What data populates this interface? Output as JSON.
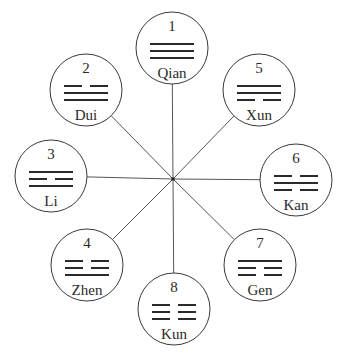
{
  "diagram": {
    "title": "",
    "center": {
      "x": 173,
      "y": 179
    },
    "circle_radius": 36,
    "line_color": "#555555",
    "stroke_color": "#3a3a3a",
    "nodes": [
      {
        "number": "1",
        "name": "Qian",
        "lines": [
          "solid",
          "solid",
          "solid"
        ],
        "cx": 172,
        "cy": 48
      },
      {
        "number": "2",
        "name": "Dui",
        "lines": [
          "broken",
          "solid",
          "solid"
        ],
        "cx": 86,
        "cy": 90
      },
      {
        "number": "3",
        "name": "Li",
        "lines": [
          "solid",
          "broken",
          "solid"
        ],
        "cx": 51,
        "cy": 176
      },
      {
        "number": "4",
        "name": "Zhen",
        "lines": [
          "broken",
          "broken",
          "solid"
        ],
        "cx": 87,
        "cy": 265
      },
      {
        "number": "5",
        "name": "Xun",
        "lines": [
          "solid",
          "solid",
          "broken"
        ],
        "cx": 259,
        "cy": 90
      },
      {
        "number": "6",
        "name": "Kan",
        "lines": [
          "broken",
          "solid",
          "broken"
        ],
        "cx": 296,
        "cy": 180
      },
      {
        "number": "7",
        "name": "Gen",
        "lines": [
          "solid",
          "broken",
          "broken"
        ],
        "cx": 260,
        "cy": 265
      },
      {
        "number": "8",
        "name": "Kun",
        "lines": [
          "broken",
          "broken",
          "broken"
        ],
        "cx": 174,
        "cy": 309
      }
    ]
  }
}
